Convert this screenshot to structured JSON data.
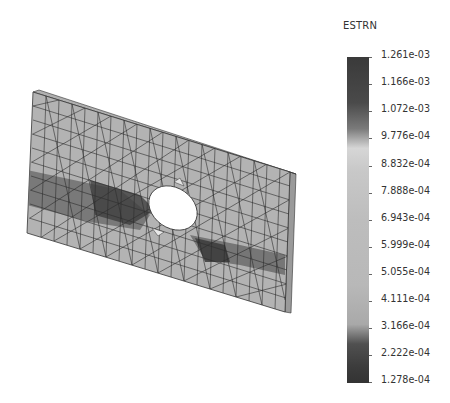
{
  "view": {
    "subject": "FEA mesh of rectangular plate with central elliptical hole",
    "shading": "grayscale strain contour"
  },
  "legend": {
    "title": "ESTRN",
    "labels": [
      "1.261e-03",
      "1.166e-03",
      "1.072e-03",
      "9.776e-04",
      "8.832e-04",
      "7.888e-04",
      "6.943e-04",
      "5.999e-04",
      "5.055e-04",
      "4.111e-04",
      "3.166e-04",
      "2.222e-04",
      "1.278e-04"
    ],
    "max": "1.261e-03",
    "min": "1.278e-04",
    "colors": {
      "high": "#3a3a3a",
      "mid": "#bdbdbd",
      "low": "#333333",
      "band_light": "#d6d6d6"
    }
  }
}
